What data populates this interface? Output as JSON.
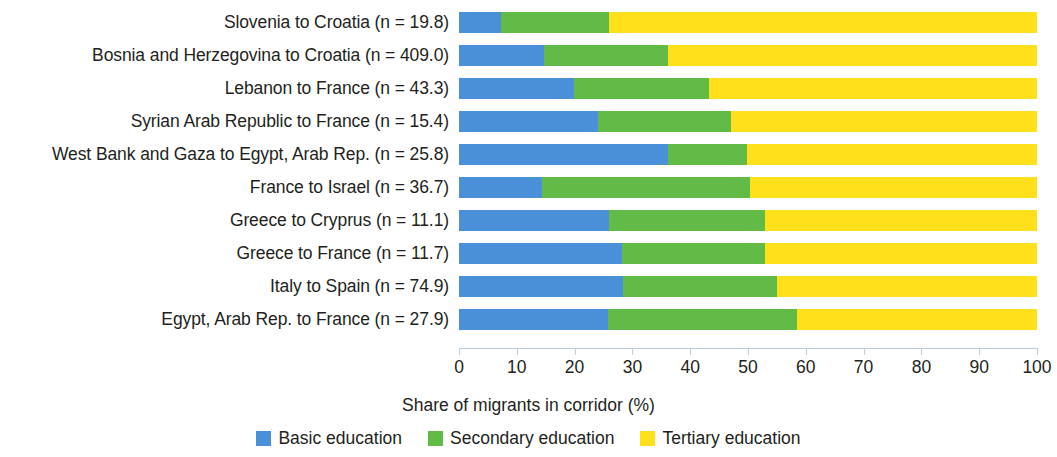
{
  "chart_data": {
    "type": "bar",
    "orientation": "horizontal",
    "stacked": true,
    "title": "",
    "xlabel": "Share of migrants in corridor (%)",
    "ylabel": "",
    "xlim": [
      0,
      100
    ],
    "xticks": [
      0,
      10,
      20,
      30,
      40,
      50,
      60,
      70,
      80,
      90,
      100
    ],
    "grid": false,
    "legend_position": "bottom",
    "categories": [
      "Slovenia to Croatia (n = 19.8)",
      "Bosnia and Herzegovina to Croatia (n = 409.0)",
      "Lebanon to France (n = 43.3)",
      "Syrian Arab Republic to France (n = 15.4)",
      "West Bank and Gaza to Egypt, Arab Rep. (n = 25.8)",
      "France to Israel (n = 36.7)",
      "Greece to Cryprus (n = 11.1)",
      "Greece to France (n = 11.7)",
      "Italy to Spain (n = 74.9)",
      "Egypt, Arab Rep. to France (n = 27.9)"
    ],
    "series": [
      {
        "name": "Basic education",
        "color": "#4a90d9",
        "values": [
          7.3,
          14.7,
          19.9,
          24.0,
          36.2,
          14.3,
          26.0,
          28.2,
          28.4,
          25.8
        ]
      },
      {
        "name": "Secondary education",
        "color": "#62bb46",
        "values": [
          18.7,
          21.5,
          23.3,
          23.0,
          13.6,
          36.0,
          27.0,
          24.8,
          26.6,
          32.6
        ]
      },
      {
        "name": "Tertiary education",
        "color": "#ffe01b",
        "values": [
          74.0,
          63.8,
          56.8,
          53.0,
          50.2,
          49.7,
          47.0,
          47.0,
          45.0,
          41.6
        ]
      }
    ]
  },
  "legend": [
    {
      "label": "Basic education",
      "color": "#4a90d9"
    },
    {
      "label": "Secondary education",
      "color": "#62bb46"
    },
    {
      "label": "Tertiary education",
      "color": "#ffe01b"
    }
  ],
  "axis": {
    "x_title": "Share of migrants in corridor (%)",
    "tick_labels": [
      "0",
      "10",
      "20",
      "30",
      "40",
      "50",
      "60",
      "70",
      "80",
      "90",
      "100"
    ]
  }
}
